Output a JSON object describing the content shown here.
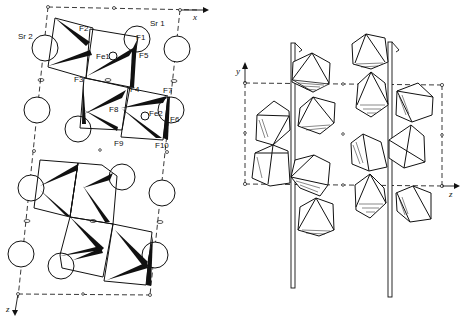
{
  "figure": {
    "left_panel": {
      "projection": "x-z",
      "axes": {
        "horizontal": "x",
        "vertical": "z"
      },
      "atom_labels": [
        {
          "id": "Sr1",
          "label": "Sr 1"
        },
        {
          "id": "Sr2",
          "label": "Sr 2"
        },
        {
          "id": "Fe1",
          "label": "Fe1"
        },
        {
          "id": "Fe2",
          "label": "Fe2"
        },
        {
          "id": "F1",
          "label": "F1"
        },
        {
          "id": "F2",
          "label": "F2"
        },
        {
          "id": "F3",
          "label": "F3"
        },
        {
          "id": "F4",
          "label": "F4"
        },
        {
          "id": "F5",
          "label": "F5"
        },
        {
          "id": "F6",
          "label": "F6"
        },
        {
          "id": "F7",
          "label": "F7"
        },
        {
          "id": "F8",
          "label": "F8"
        },
        {
          "id": "F9",
          "label": "F9"
        },
        {
          "id": "F10",
          "label": "F10"
        }
      ]
    },
    "right_panel": {
      "projection": "y-z",
      "axes": {
        "horizontal": "z",
        "vertical": "y"
      },
      "screw_axes": 2
    },
    "colors": {
      "ink": "#111111",
      "background": "#ffffff"
    }
  }
}
